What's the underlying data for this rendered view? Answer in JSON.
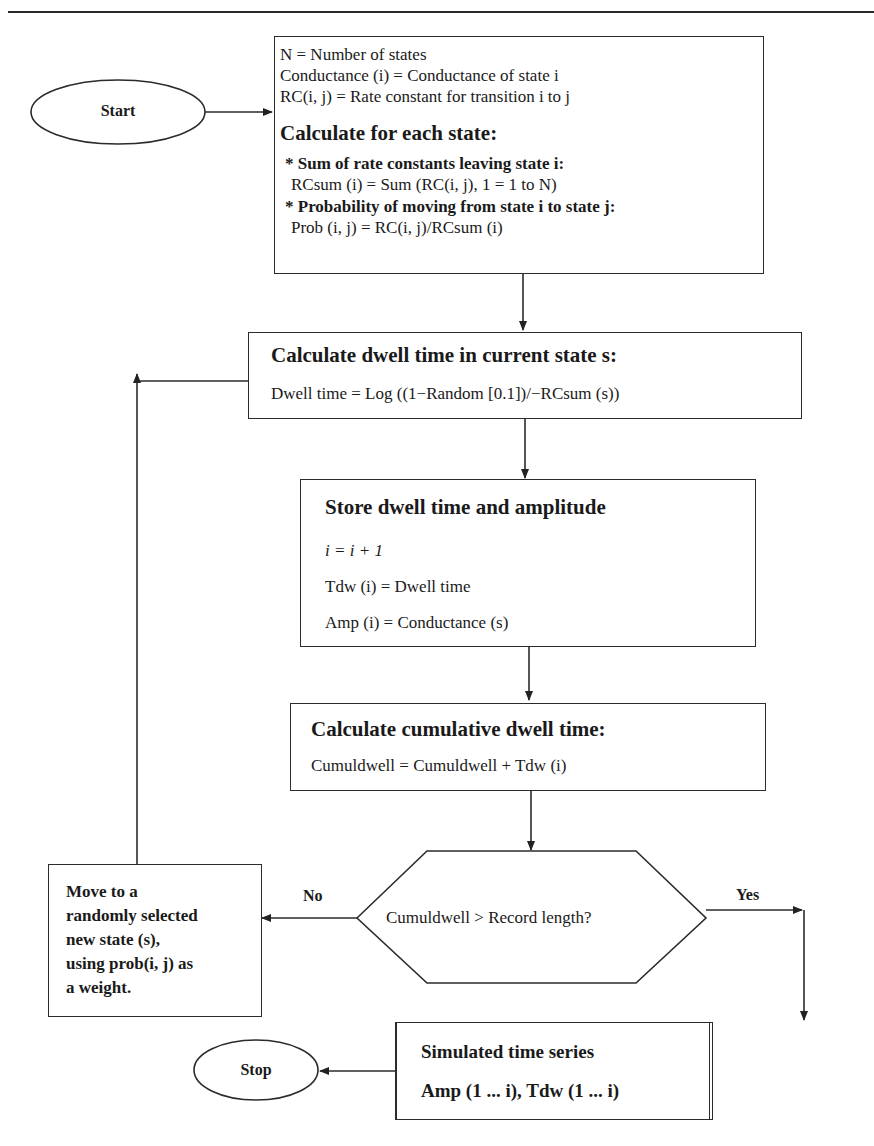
{
  "flowchart": {
    "start": {
      "label": "Start"
    },
    "stop": {
      "label": "Stop"
    },
    "definitions_box": {
      "lines": [
        "N = Number of states",
        "Conductance (i) = Conductance of state i",
        "RC(i, j) = Rate constant for transition i to j"
      ],
      "heading": "Calculate for each state:",
      "bullet1_title": "* Sum of rate constants leaving state i:",
      "bullet1_formula": "RCsum (i) = Sum (RC(i, j), 1 = 1 to N)",
      "bullet2_title": "* Probability of moving from state i to state j:",
      "bullet2_formula": "Prob (i, j) = RC(i, j)/RCsum (i)"
    },
    "dwell_box": {
      "heading": "Calculate dwell time in current state s:",
      "formula": "Dwell time = Log ((1−Random [0.1])/−RCsum (s))"
    },
    "store_box": {
      "heading": "Store dwell time and amplitude",
      "line1": "i = i + 1",
      "line2": "Tdw (i) = Dwell time",
      "line3": "Amp (i) = Conductance (s)"
    },
    "cumulative_box": {
      "heading": "Calculate cumulative dwell time:",
      "formula": "Cumuldwell = Cumuldwell + Tdw (i)"
    },
    "decision": {
      "question": "Cumuldwell > Record length?",
      "no_label": "No",
      "yes_label": "Yes"
    },
    "move_box": {
      "lines": [
        "Move to a",
        "randomly selected",
        "new state (s),",
        "using prob(i, j) as",
        "a weight."
      ]
    },
    "output_box": {
      "line1": "Simulated time series",
      "line2": "Amp (1 ... i), Tdw (1 ... i)"
    }
  }
}
